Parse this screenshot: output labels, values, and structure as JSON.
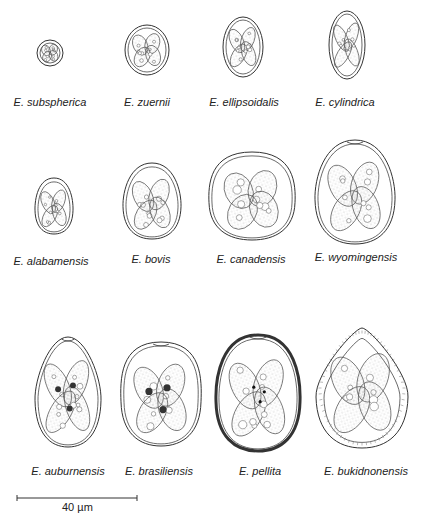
{
  "figure": {
    "type": "scientific-illustration",
    "rows": [
      {
        "species": [
          {
            "label": "E. subspherica",
            "cx": 50,
            "cy": 53,
            "rx": 13,
            "ry": 13
          },
          {
            "label": "E. zuernii",
            "cx": 147,
            "cy": 50,
            "rx": 22,
            "ry": 25
          },
          {
            "label": "E. ellipsoidalis",
            "cx": 243,
            "cy": 47,
            "rx": 20,
            "ry": 30
          },
          {
            "label": "E. cylindrica",
            "cx": 347,
            "cy": 45,
            "rx": 18,
            "ry": 34
          }
        ]
      },
      {
        "species": [
          {
            "label": "E. alabamensis",
            "cx": 54,
            "cy": 206,
            "rx": 19,
            "ry": 28
          },
          {
            "label": "E. bovis",
            "cx": 152,
            "cy": 201,
            "rx": 29,
            "ry": 38
          },
          {
            "label": "E. canadensis",
            "cx": 252,
            "cy": 196,
            "rx": 43,
            "ry": 44
          },
          {
            "label": "E. wyomingensis",
            "cx": 355,
            "cy": 192,
            "rx": 40,
            "ry": 52
          }
        ]
      },
      {
        "species": [
          {
            "label": "E. auburnensis",
            "cx": 68,
            "cy": 392,
            "rx": 33,
            "ry": 55
          },
          {
            "label": "E. brasiliensis",
            "cx": 161,
            "cy": 394,
            "rx": 40,
            "ry": 52
          },
          {
            "label": "E. pellita",
            "cx": 258,
            "cy": 393,
            "rx": 42,
            "ry": 58
          },
          {
            "label": "E. bukidnonensis",
            "cx": 362,
            "cy": 388,
            "rx": 46,
            "ry": 60
          }
        ]
      }
    ],
    "scale_bar": {
      "label": "40 µm",
      "x1": 17,
      "x2": 137,
      "y": 498
    }
  },
  "labels": {
    "r0": [
      "E. subspherica",
      "E. zuernii",
      "E. ellipsoidalis",
      "E. cylindrica"
    ],
    "r1": [
      "E. alabamensis",
      "E. bovis",
      "E. canadensis",
      "E. wyomingensis"
    ],
    "r2": [
      "E. auburnensis",
      "E. brasiliensis",
      "E. pellita",
      "E. bukidnonensis"
    ],
    "scale": "40 µm"
  }
}
